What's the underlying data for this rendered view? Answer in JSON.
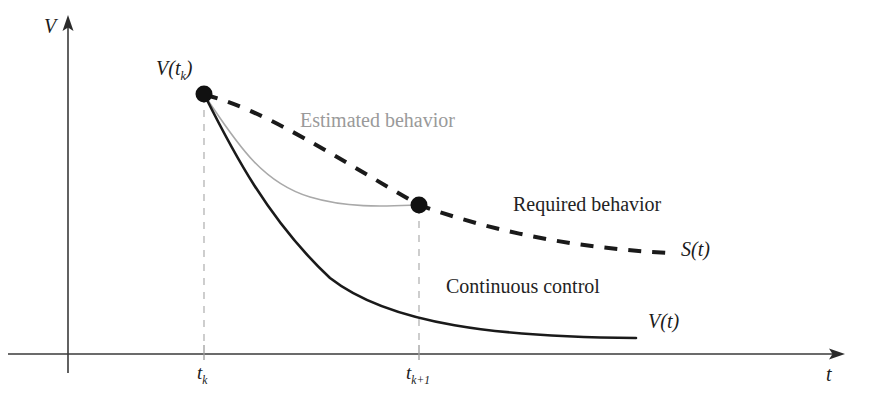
{
  "figure": {
    "kind": "line-diagram",
    "background_color": "#ffffff",
    "axes": {
      "y_label": "V",
      "x_label": "t",
      "origin": {
        "x": 68,
        "y": 354
      },
      "axis_color": "#3a3a3a"
    },
    "ticks": [
      {
        "name": "tk",
        "label_main": "t",
        "label_sub": "k",
        "x": 205
      },
      {
        "name": "tk1",
        "label_main": "t",
        "label_sub": "k+1",
        "x": 419
      }
    ],
    "points": [
      {
        "name": "point-vtk",
        "x": 204,
        "y": 94,
        "radius": 8,
        "color": "#111111"
      },
      {
        "name": "point-tk1",
        "x": 419,
        "y": 205,
        "radius": 8,
        "color": "#111111"
      }
    ],
    "point_label": {
      "text_main": "V(t",
      "text_sub": "k",
      "text_tail": ")"
    },
    "curves": [
      {
        "name": "required-behavior",
        "style": "dashed",
        "color": "#1a1a1a",
        "width": 4,
        "dash": "13 11",
        "end_label": "S(t)"
      },
      {
        "name": "estimated-behavior",
        "style": "solid-thin",
        "color": "#a9a9a9",
        "width": 1.6
      },
      {
        "name": "continuous-control",
        "style": "solid",
        "color": "#1a1a1a",
        "width": 2.6,
        "end_label": "V(t)"
      }
    ],
    "annotations": [
      {
        "name": "estimated-behavior-label",
        "text": "Estimated behavior",
        "color": "#9a9a9a",
        "x": 300,
        "y": 112
      },
      {
        "name": "required-behavior-label",
        "text": "Required behavior",
        "color": "#232323",
        "x": 513,
        "y": 196
      },
      {
        "name": "continuous-control-label",
        "text": "Continuous control",
        "color": "#232323",
        "x": 446,
        "y": 278
      }
    ],
    "end_labels": [
      {
        "name": "s-of-t-label",
        "text": "S(t)",
        "x": 681,
        "y": 240
      },
      {
        "name": "v-of-t-label",
        "text": "V(t)",
        "x": 648,
        "y": 312
      }
    ]
  }
}
